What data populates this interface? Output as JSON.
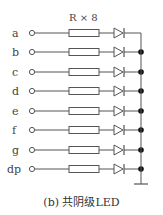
{
  "resistor_label": "R × 8",
  "caption": "(b) 共阴级LED",
  "colors": {
    "line": "#555555",
    "dot": "#111111"
  },
  "rows": [
    {
      "label": "a",
      "y": 33
    },
    {
      "label": "b",
      "y": 52
    },
    {
      "label": "c",
      "y": 72
    },
    {
      "label": "d",
      "y": 91
    },
    {
      "label": "e",
      "y": 111
    },
    {
      "label": "f",
      "y": 130
    },
    {
      "label": "g",
      "y": 150
    },
    {
      "label": "dp",
      "y": 169
    }
  ]
}
